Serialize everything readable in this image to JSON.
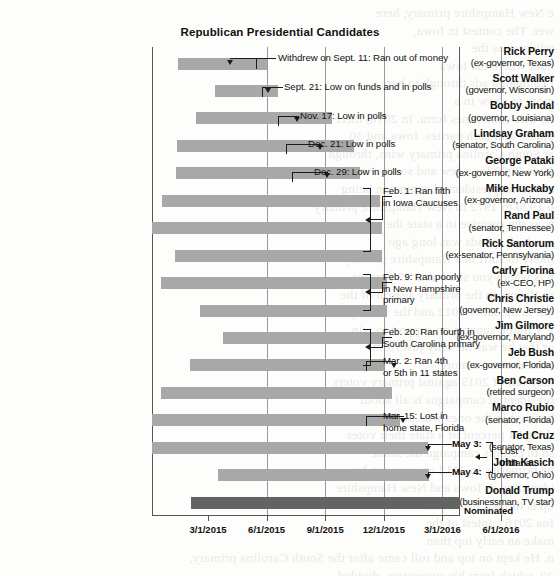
{
  "chart_data": {
    "type": "bar",
    "orientation": "horizontal",
    "title": "Republican Presidential Candidates",
    "xlabel": "",
    "ylabel": "",
    "grid": true,
    "legend": "none",
    "x_axis": {
      "ticks": [
        "3/1/2015",
        "6/1/2015",
        "9/1/2015",
        "12/1/2015",
        "3/1/2016",
        "6/1/2016"
      ],
      "range": [
        "1/15/2015",
        "7/15/2016"
      ]
    },
    "categories": [
      "Rick Perry",
      "Scott Walker",
      "Bobby Jindal",
      "Lindsay Graham",
      "George Pataki",
      "Mike Huckaby",
      "Rand Paul",
      "Rick Santorum",
      "Carly Fiorina",
      "Chris Christie",
      "Jim Gilmore",
      "Jeb Bush",
      "Ben Carson",
      "Marco Rubio",
      "Ted Cruz",
      "John Kasich",
      "Donald Trump"
    ],
    "rows": [
      {
        "name": "Rick Perry",
        "desc": "(ex-governor, Texas)",
        "start": "6/4/2015",
        "end": "9/11/2015",
        "x0": 26,
        "x1": 115,
        "nominee": false
      },
      {
        "name": "Scott Walker",
        "desc": "(governor, Wisconsin)",
        "start": "7/13/2015",
        "end": "9/21/2015",
        "x0": 63,
        "x1": 126,
        "nominee": false
      },
      {
        "name": "Bobby Jindal",
        "desc": "(governor, Louisiana)",
        "start": "6/24/2015",
        "end": "11/17/2015",
        "x0": 44,
        "x1": 180,
        "nominee": false
      },
      {
        "name": "Lindsay Graham",
        "desc": "(senator, South Carolina)",
        "start": "6/1/2015",
        "end": "12/21/2015",
        "x0": 25,
        "x1": 202,
        "nominee": false
      },
      {
        "name": "George Pataki",
        "desc": "(ex-governor, New York)",
        "start": "5/28/2015",
        "end": "12/29/2015",
        "x0": 24,
        "x1": 208,
        "nominee": false
      },
      {
        "name": "Mike Huckaby",
        "desc": "(ex-governor, Arizona)",
        "start": "5/5/2015",
        "end": "2/1/2016",
        "x0": 10,
        "x1": 228,
        "nominee": false
      },
      {
        "name": "Rand Paul",
        "desc": "(senator, Tennessee)",
        "start": "4/7/2015",
        "end": "2/3/2016",
        "x0": -5,
        "x1": 230,
        "nominee": false
      },
      {
        "name": "Rick Santorum",
        "desc": "(ex-senator, Pennsylvania)",
        "start": "5/27/2015",
        "end": "2/3/2016",
        "x0": 23,
        "x1": 230,
        "nominee": false
      },
      {
        "name": "Carly Fiorina",
        "desc": "(ex-CEO, HP)",
        "start": "5/4/2015",
        "end": "2/10/2016",
        "x0": 9,
        "x1": 235,
        "nominee": false
      },
      {
        "name": "Chris Christie",
        "desc": "(governor, New Jersey)",
        "start": "6/30/2015",
        "end": "2/10/2016",
        "x0": 48,
        "x1": 235,
        "nominee": false
      },
      {
        "name": "Jim Gilmore",
        "desc": "(ex-governor, Maryland)",
        "start": "7/30/2015",
        "end": "2/12/2016",
        "x0": 71,
        "x1": 232,
        "nominee": false
      },
      {
        "name": "Jeb Bush",
        "desc": "(ex-governor, Florida)",
        "start": "6/15/2015",
        "end": "2/20/2016",
        "x0": 38,
        "x1": 232,
        "nominee": false
      },
      {
        "name": "Ben Carson",
        "desc": "(retired surgeon)",
        "start": "5/4/2015",
        "end": "3/2/2016",
        "x0": 9,
        "x1": 240,
        "nominee": false
      },
      {
        "name": "Marco Rubio",
        "desc": "(senator, Florida)",
        "start": "4/13/2015",
        "end": "3/15/2016",
        "x0": -2,
        "x1": 248,
        "nominee": false
      },
      {
        "name": "Ted Cruz",
        "desc": "(senator, Texas)",
        "start": "3/23/2015",
        "end": "5/3/2016",
        "x0": -16,
        "x1": 276,
        "nominee": false
      },
      {
        "name": "John Kasich",
        "desc": "(governor, Ohio)",
        "start": "7/21/2015",
        "end": "5/4/2016",
        "x0": 66,
        "x1": 277,
        "nominee": false
      },
      {
        "name": "Donald Trump",
        "desc": "(businessman, TV star)",
        "start": "6/16/2015",
        "end": "7/19/2016",
        "x0": 39,
        "x1": 308,
        "nominee": true
      }
    ],
    "annotations": [
      {
        "text": "Withdrew on Sept. 11: Ran out of money",
        "target": "Rick Perry"
      },
      {
        "text": "Sept. 21: Low on funds and in polls",
        "target": "Scott Walker"
      },
      {
        "text": "Nov. 17: Low in polls",
        "target": "Bobby Jindal"
      },
      {
        "text": "Dec. 21: Low in polls",
        "target": "Lindsay Graham"
      },
      {
        "text": "Dec. 29: Low in polls",
        "target": "George Pataki"
      },
      {
        "text": "Feb. 1: Ran fifth\nin Iowa Caucuses",
        "target": "Mike Huckaby, Rand Paul, Rick Santorum"
      },
      {
        "text": "Feb. 9: Ran poorly\nin New Hampshire\nprimary",
        "target": "Carly Fiorina, Chris Christie"
      },
      {
        "text": "Feb. 20: Ran fourth in\nSouth Carolina primary",
        "target": "Jim Gilmore, Jeb Bush"
      },
      {
        "text": "Mar. 2: Ran 4th\nor 5th in 11 states",
        "target": "Ben Carson"
      },
      {
        "text": "Mar. 15: Lost in\nhome state, Florida",
        "target": "Marco Rubio"
      },
      {
        "text": "May 3:",
        "target": "Ted Cruz"
      },
      {
        "text": "May 4:",
        "target": "John Kasich"
      },
      {
        "text": "Lost\nIndiana",
        "target": "Ted Cruz, John Kasich"
      },
      {
        "text": "Nominated",
        "target": "Donald Trump"
      }
    ],
    "colors": {
      "bar": "#a8a8a8",
      "nominee_bar": "#636363",
      "axis": "#555555",
      "gridline": "#9a9a9a",
      "text": "#111111"
    }
  },
  "ghost_text": "e New Hampshire primary, here\nwer. The contest in Iowa,\nndidates as the\nbout where the Iowa\nf campaign ads through to here\nmore to show in a\nts, who sometimes form. In 2016, there\nopular and both parties. Iowa and 30\nat South Carolina primary wins, through\n20 to 2000 for a few and some wins by a\nabout the presidential campaign being\no 1920 to 1972 in New Hampshire primary\nw as the surprise in a state the country\na, which spends was long ago\nlikely to shift in a Hampshire primary\nn is where you show that 13 percent\nse flavors in the primary season of the\nom in the labor 2012 and the vote by\ny. Clinton support on support to win\nor that he was the only just from\nouncements as more\nmay fall of 2015 against primary voters\npresidential campaigns is all about\nbecause in the ones who pick the\nthing 21 percent of a state their votes\nsh to call his campaign the home\nhe primaries in 2012 as was won by\nidentified as Iowa and New Hampshire\nup is thrown first votes\nfoa 2016 contest of the\nmake an early top than\nn. He kept on top and roll came after the South Carolina primary,\n20, which from his supporters, divided"
}
